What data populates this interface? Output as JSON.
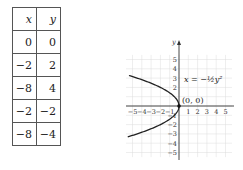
{
  "table": {
    "headers": [
      "x",
      "y"
    ],
    "rows": [
      [
        "0",
        "0"
      ],
      [
        "−2",
        "2"
      ],
      [
        "−8",
        "4"
      ],
      [
        "−2",
        "−2"
      ],
      [
        "−8",
        "−4"
      ]
    ]
  },
  "chart_data": {
    "type": "line",
    "title": "",
    "xlabel": "x",
    "ylabel": "y",
    "equation_label": "x = −½y²",
    "point_label": "(0, 0)",
    "xlim": [
      -5.5,
      5.5
    ],
    "ylim": [
      -5.5,
      5.5
    ],
    "grid": true,
    "x_ticks": [
      "−5",
      "−4",
      "−3",
      "−2",
      "−1",
      "1",
      "2",
      "3",
      "4",
      "5"
    ],
    "y_ticks": [
      "5",
      "4",
      "3",
      "2",
      "1",
      "−1",
      "−2",
      "−3",
      "−4",
      "−5"
    ],
    "series": [
      {
        "name": "x = -1/2 y^2",
        "x": [
          -5.5,
          -4.5,
          -2,
          -0.5,
          0,
          -0.5,
          -2,
          -4.5,
          -5.5
        ],
        "y": [
          3.32,
          3,
          2,
          1,
          0,
          -1,
          -2,
          -3,
          -3.32
        ]
      }
    ],
    "points": [
      {
        "x": 0,
        "y": 0,
        "label": "(0, 0)"
      }
    ]
  }
}
